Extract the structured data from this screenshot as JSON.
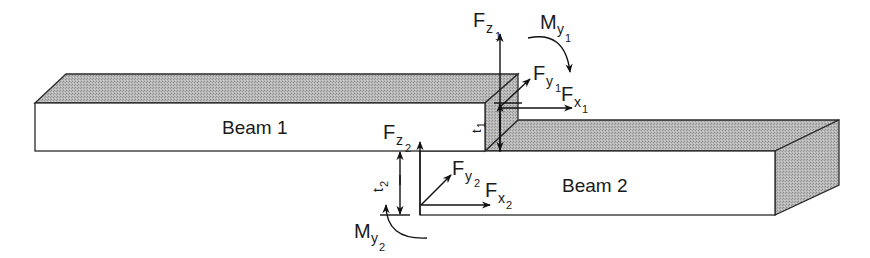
{
  "diagram": {
    "beams": [
      {
        "id": "beam1",
        "label": "Beam 1"
      },
      {
        "id": "beam2",
        "label": "Beam 2"
      }
    ],
    "thickness_labels": {
      "t1": {
        "main": "t",
        "sub": "1"
      },
      "t2": {
        "main": "t",
        "sub": "2"
      }
    },
    "forces_joint1": {
      "Fz": {
        "main": "F",
        "sub": "z",
        "subsub": "1"
      },
      "Fy": {
        "main": "F",
        "sub": "y",
        "subsub": "1"
      },
      "Fx": {
        "main": "F",
        "sub": "x",
        "subsub": "1"
      },
      "My": {
        "main": "M",
        "sub": "y",
        "subsub": "1"
      }
    },
    "forces_joint2": {
      "Fz": {
        "main": "F",
        "sub": "z",
        "subsub": "2"
      },
      "Fy": {
        "main": "F",
        "sub": "y",
        "subsub": "2"
      },
      "Fx": {
        "main": "F",
        "sub": "x",
        "subsub": "2"
      },
      "My": {
        "main": "M",
        "sub": "y",
        "subsub": "2"
      }
    },
    "colors": {
      "face_front": "#ffffff",
      "face_shaded": "#b4b4b4",
      "stroke": "#2a2a2a"
    }
  }
}
